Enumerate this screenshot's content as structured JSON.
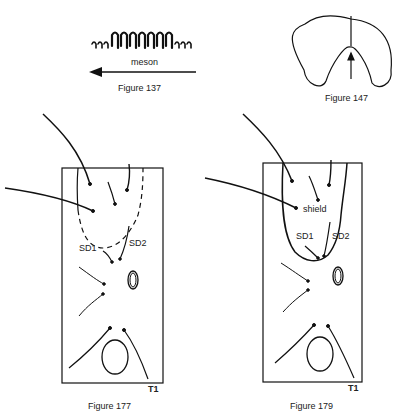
{
  "figures": [
    {
      "id": "fig137",
      "caption": "Figure 137",
      "arrow_label": "meson",
      "comb_glyphs": "ııı11111111ııı"
    },
    {
      "id": "fig147",
      "caption": "Figure 147"
    },
    {
      "id": "fig177",
      "caption": "Figure 177",
      "labels": {
        "sd1": "SD1",
        "sd2": "SD2",
        "t1": "T1"
      }
    },
    {
      "id": "fig179",
      "caption": "Figure 179",
      "labels": {
        "shield": "shield",
        "sd1": "SD1",
        "sd2": "SD2",
        "t1": "T1"
      }
    }
  ],
  "colors": {
    "ink": "#111111",
    "background": "#ffffff"
  }
}
